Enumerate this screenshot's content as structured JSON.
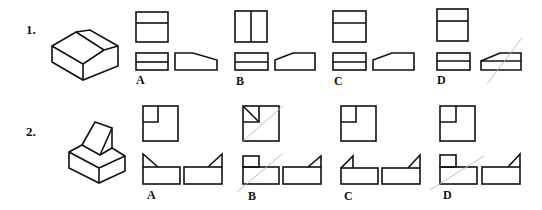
{
  "problems": [
    {
      "number": "1.",
      "description": "Isometric block with a sloped/chamfered top face; choose correct top, front, side views",
      "options": [
        {
          "label": "A"
        },
        {
          "label": "B"
        },
        {
          "label": "C"
        },
        {
          "label": "D"
        }
      ]
    },
    {
      "number": "2.",
      "description": "Isometric base block with a triangular wedge on top; choose correct top, front, side views",
      "options": [
        {
          "label": "A"
        },
        {
          "label": "B"
        },
        {
          "label": "C"
        },
        {
          "label": "D"
        }
      ]
    }
  ],
  "colors": {
    "line": "#111111",
    "construction_line": "#b8b8b8",
    "background": "#ffffff"
  }
}
